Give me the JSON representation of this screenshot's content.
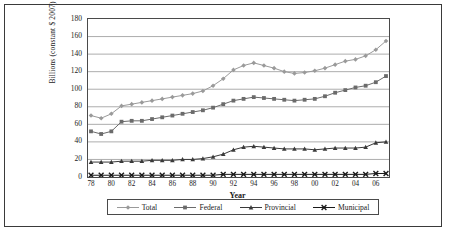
{
  "chart_data": {
    "type": "line",
    "title": "",
    "xlabel": "Year",
    "ylabel": "Billions (constant $ 2007)",
    "ylim": [
      0,
      180
    ],
    "yticks": [
      0,
      20,
      40,
      60,
      80,
      100,
      120,
      140,
      160,
      180
    ],
    "grid": true,
    "legend_position": "bottom",
    "x": [
      "78",
      "79",
      "80",
      "81",
      "82",
      "83",
      "84",
      "85",
      "86",
      "87",
      "88",
      "89",
      "90",
      "91",
      "92",
      "93",
      "94",
      "95",
      "96",
      "97",
      "98",
      "99",
      "00",
      "01",
      "02",
      "03",
      "04",
      "05",
      "06",
      "07"
    ],
    "xtick_labels": [
      "78",
      "80",
      "82",
      "84",
      "86",
      "88",
      "90",
      "92",
      "94",
      "96",
      "98",
      "00",
      "02",
      "04",
      "06"
    ],
    "series": [
      {
        "name": "Total",
        "marker": "diamond",
        "color": "#9a9a9a",
        "values": [
          70,
          67,
          72,
          81,
          83,
          85,
          87,
          89,
          91,
          93,
          95,
          98,
          104,
          112,
          122,
          127,
          130,
          127,
          124,
          120,
          118,
          119,
          121,
          124,
          128,
          132,
          134,
          138,
          145,
          155
        ]
      },
      {
        "name": "Federal",
        "marker": "square",
        "color": "#6b6b6b",
        "values": [
          52,
          49,
          52,
          63,
          64,
          64,
          66,
          68,
          70,
          72,
          74,
          76,
          79,
          83,
          87,
          89,
          91,
          90,
          89,
          88,
          87,
          88,
          89,
          92,
          96,
          99,
          102,
          104,
          108,
          115
        ]
      },
      {
        "name": "Provincial",
        "marker": "triangle",
        "color": "#3a3a3a",
        "values": [
          17,
          17,
          17,
          18,
          18,
          18,
          19,
          19,
          19,
          20,
          20,
          21,
          23,
          26,
          31,
          34,
          35,
          34,
          33,
          32,
          32,
          32,
          31,
          32,
          33,
          33,
          33,
          34,
          39,
          40
        ]
      },
      {
        "name": "Municipal",
        "marker": "x",
        "color": "#1a1a1a",
        "values": [
          2,
          2,
          2,
          2,
          2,
          2,
          2,
          2,
          2,
          2,
          2,
          2,
          2,
          3,
          3,
          3,
          3,
          3,
          3,
          3,
          3,
          3,
          3,
          3,
          3,
          3,
          3,
          3,
          4,
          4
        ]
      }
    ]
  }
}
